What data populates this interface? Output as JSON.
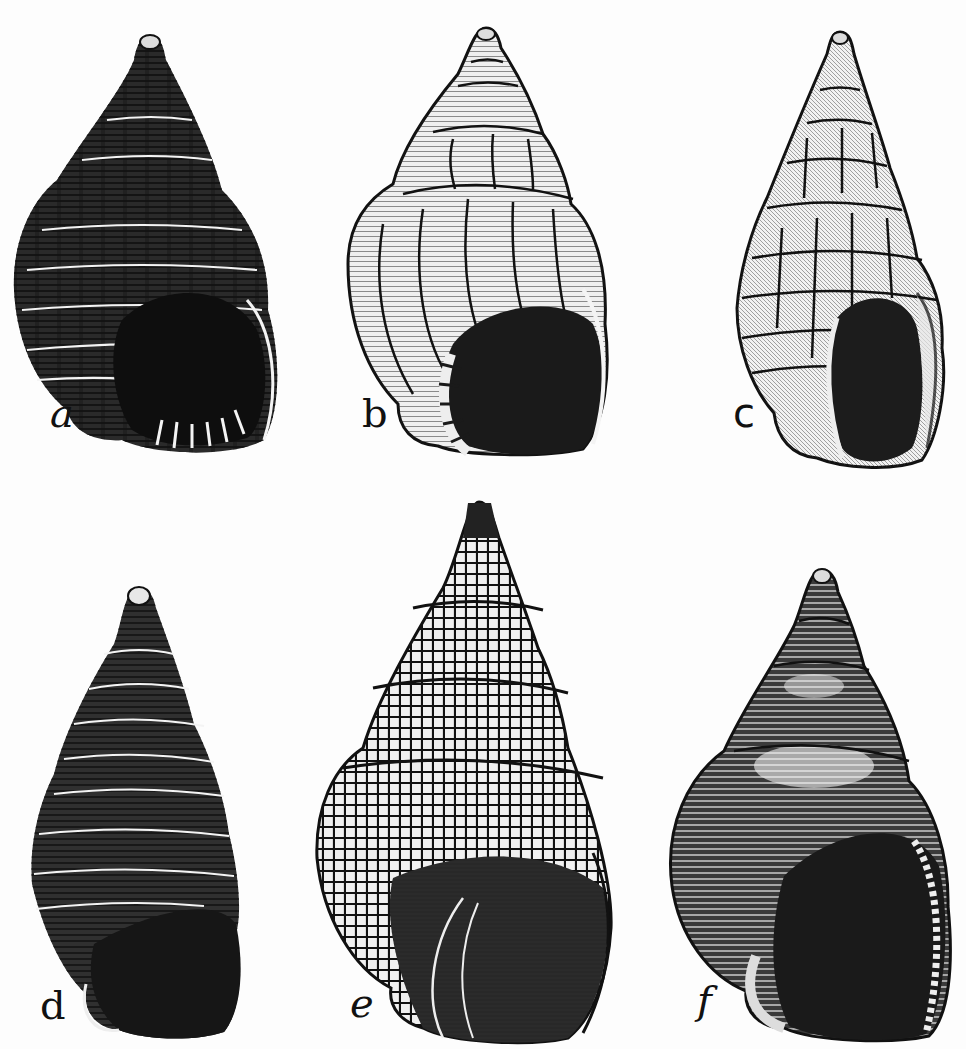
{
  "figure": {
    "type": "scientific illustration plate",
    "ink_color": "#111111",
    "paper_color": "#fdfdfd",
    "layout": {
      "rows": 2,
      "columns": 3
    },
    "panels": [
      {
        "id": "a",
        "label": "a",
        "sculpture": "coarse spiral cords over axial ribs, dark dentate aperture",
        "row": 1,
        "col": 1
      },
      {
        "id": "b",
        "label": "b",
        "sculpture": "broad axial ribs with fine spiral lines, flared ridged lip",
        "row": 1,
        "col": 2
      },
      {
        "id": "c",
        "label": "c",
        "sculpture": "strongly shouldered whorls, cancellate knobby lattice",
        "row": 1,
        "col": 3
      },
      {
        "id": "d",
        "label": "d",
        "sculpture": "elongate spire with beaded spiral cords, dark aperture",
        "row": 2,
        "col": 1
      },
      {
        "id": "e",
        "label": "e",
        "sculpture": "large shell with fine cancellate beaded lattice",
        "row": 2,
        "col": 2
      },
      {
        "id": "f",
        "label": "f",
        "sculpture": "smooth rounded whorls with fine spiral lines, toothed outer lip",
        "row": 2,
        "col": 3
      }
    ]
  }
}
